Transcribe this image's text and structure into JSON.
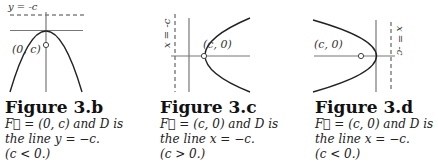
{
  "figures": [
    {
      "id": "3.b",
      "title": "Figure 3.b",
      "directrix_label": "y = -c",
      "focus_label": "(0, c)",
      "caption_line1": "F⃗ = (0, c) and D is",
      "caption_line2": "the line y = −c.",
      "caption_line3": "(c < 0.)"
    },
    {
      "id": "3.c",
      "title": "Figure 3.c",
      "directrix_label": "x = -c",
      "focus_label": "(c, 0)",
      "caption_line1": "F⃗ = (c, 0) and D is",
      "caption_line2": "the line x = −c.",
      "caption_line3": "(c > 0.)"
    },
    {
      "id": "3.d",
      "title": "Figure 3.d",
      "directrix_label": "x = -c",
      "focus_label": "(c, 0)",
      "caption_line1": "F⃗ = (c, 0) and D is",
      "caption_line2": "the line x = −c.",
      "caption_line3": "(c < 0.)"
    }
  ]
}
